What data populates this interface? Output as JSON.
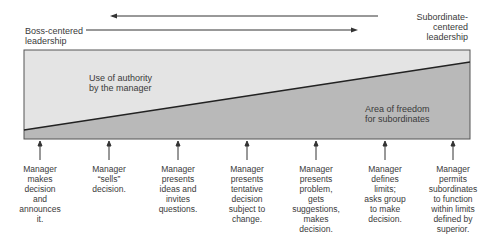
{
  "header": {
    "left_label": "Boss-centered leadership",
    "left_label_line1": "Boss-centered",
    "left_label_line2": "leadership",
    "right_label_line1": "Subordinate-centered",
    "right_label_line2": "leadership"
  },
  "regions": {
    "upper_line1": "Use of authority",
    "upper_line2": "by the manager",
    "lower_line1": "Area of freedom",
    "lower_line2": "for subordinates"
  },
  "colors": {
    "upper_fill": "#e4e4e4",
    "lower_fill": "#b9b9b9",
    "line": "#333333"
  },
  "behaviors": [
    {
      "lines": [
        "Manager",
        "makes",
        "decision",
        "and",
        "announces",
        "it."
      ]
    },
    {
      "lines": [
        "Manager",
        "“sells”",
        "decision."
      ]
    },
    {
      "lines": [
        "Manager",
        "presents",
        "ideas and",
        "invites",
        "questions."
      ]
    },
    {
      "lines": [
        "Manager",
        "presents",
        "tentative",
        "decision",
        "subject to",
        "change."
      ]
    },
    {
      "lines": [
        "Manager",
        "presents",
        "problem,",
        "gets",
        "suggestions,",
        "makes",
        "decision."
      ]
    },
    {
      "lines": [
        "Manager",
        "defines",
        "limits;",
        "asks group",
        "to make",
        "decision."
      ]
    },
    {
      "lines": [
        "Manager",
        "permits",
        "subordinates",
        "to function",
        "within limits",
        "defined by",
        "superior."
      ]
    }
  ]
}
